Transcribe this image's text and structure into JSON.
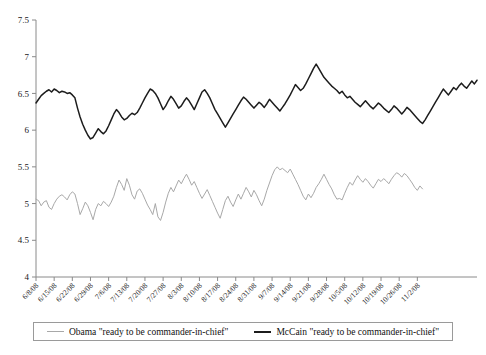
{
  "chart_data": {
    "type": "line",
    "title": "",
    "subtitle": "",
    "xlabel": "",
    "ylabel": "",
    "ylim": [
      4,
      7.5
    ],
    "ytick_step": 0.5,
    "yticks": [
      "7.5",
      "7",
      "6.5",
      "6",
      "5.5",
      "5",
      "4.5",
      "4"
    ],
    "ytick_values": [
      7.5,
      7,
      6.5,
      6,
      5.5,
      5,
      4.5,
      4
    ],
    "grid": false,
    "legend_position": "bottom",
    "x_start": "6/8/08",
    "x_end": "11/2/08",
    "xticks": [
      "6/8/08",
      "6/15/08",
      "6/22/08",
      "6/29/08",
      "7/6/08",
      "7/13/08",
      "7/20/08",
      "7/27/08",
      "8/3/08",
      "8/10/08",
      "8/17/08",
      "8/24/08",
      "8/31/08",
      "9/7/08",
      "9/14/08",
      "9/21/08",
      "9/28/08",
      "10/5/08",
      "10/12/08",
      "10/19/08",
      "10/26/08",
      "11/2/08"
    ],
    "xtick_index": [
      0,
      7,
      14,
      21,
      28,
      35,
      42,
      49,
      56,
      63,
      70,
      77,
      84,
      91,
      98,
      105,
      112,
      119,
      126,
      133,
      140,
      147
    ],
    "n_points": 148,
    "series": [
      {
        "name": "Obama \"ready to be commander-in-chief\"",
        "color": "#a8a8a8",
        "values": [
          5.06,
          5.04,
          4.97,
          5.02,
          5.04,
          4.95,
          4.92,
          5.0,
          5.06,
          5.1,
          5.12,
          5.09,
          5.05,
          5.12,
          5.16,
          5.13,
          5.0,
          4.85,
          4.93,
          5.02,
          4.97,
          4.88,
          4.78,
          4.92,
          5.0,
          4.97,
          5.03,
          5.0,
          4.96,
          5.02,
          5.1,
          5.22,
          5.32,
          5.26,
          5.18,
          5.34,
          5.25,
          5.12,
          5.06,
          5.17,
          5.2,
          5.14,
          5.06,
          4.98,
          4.92,
          4.85,
          5.0,
          4.82,
          4.77,
          4.88,
          5.02,
          5.14,
          5.22,
          5.16,
          5.24,
          5.32,
          5.27,
          5.34,
          5.4,
          5.33,
          5.25,
          5.3,
          5.22,
          5.14,
          5.07,
          5.13,
          5.19,
          5.11,
          5.03,
          4.95,
          4.87,
          4.8,
          4.92,
          5.04,
          5.1,
          5.02,
          4.96,
          5.05,
          5.13,
          5.06,
          5.14,
          5.22,
          5.16,
          5.09,
          5.18,
          5.12,
          5.04,
          4.97,
          5.06,
          5.18,
          5.28,
          5.38,
          5.46,
          5.5,
          5.46,
          5.48,
          5.45,
          5.42,
          5.47,
          5.4,
          5.33,
          5.26,
          5.18,
          5.1,
          5.05,
          5.13,
          5.08,
          5.14,
          5.22,
          5.27,
          5.33,
          5.4,
          5.33,
          5.26,
          5.2,
          5.12,
          5.06,
          5.07,
          5.05,
          5.14,
          5.22,
          5.29,
          5.25,
          5.32,
          5.38,
          5.33,
          5.29,
          5.34,
          5.3,
          5.25,
          5.21,
          5.27,
          5.33,
          5.3,
          5.34,
          5.31,
          5.27,
          5.33,
          5.38,
          5.42,
          5.4,
          5.36,
          5.41,
          5.38,
          5.33,
          5.28,
          5.22,
          5.18,
          5.24,
          5.2
        ]
      },
      {
        "name": "McCain \"ready to be commander-in-chief\"",
        "color": "#1c1c1c",
        "values": [
          6.37,
          6.42,
          6.47,
          6.5,
          6.53,
          6.55,
          6.52,
          6.56,
          6.54,
          6.51,
          6.53,
          6.52,
          6.5,
          6.51,
          6.48,
          6.44,
          6.3,
          6.18,
          6.08,
          6.0,
          5.93,
          5.88,
          5.9,
          5.96,
          6.02,
          5.98,
          5.95,
          5.99,
          6.06,
          6.14,
          6.22,
          6.28,
          6.24,
          6.18,
          6.14,
          6.16,
          6.2,
          6.23,
          6.21,
          6.24,
          6.3,
          6.37,
          6.44,
          6.5,
          6.56,
          6.54,
          6.5,
          6.44,
          6.36,
          6.28,
          6.33,
          6.4,
          6.46,
          6.42,
          6.36,
          6.3,
          6.33,
          6.39,
          6.44,
          6.4,
          6.34,
          6.28,
          6.36,
          6.44,
          6.52,
          6.55,
          6.5,
          6.44,
          6.36,
          6.28,
          6.22,
          6.16,
          6.1,
          6.04,
          6.1,
          6.16,
          6.22,
          6.28,
          6.34,
          6.4,
          6.45,
          6.42,
          6.38,
          6.34,
          6.3,
          6.34,
          6.38,
          6.35,
          6.31,
          6.36,
          6.42,
          6.38,
          6.34,
          6.3,
          6.26,
          6.31,
          6.36,
          6.42,
          6.48,
          6.55,
          6.62,
          6.58,
          6.54,
          6.57,
          6.63,
          6.7,
          6.77,
          6.84,
          6.9,
          6.84,
          6.78,
          6.72,
          6.68,
          6.64,
          6.6,
          6.57,
          6.54,
          6.5,
          6.53,
          6.48,
          6.44,
          6.46,
          6.42,
          6.38,
          6.35,
          6.32,
          6.36,
          6.4,
          6.36,
          6.32,
          6.29,
          6.33,
          6.37,
          6.34,
          6.3,
          6.27,
          6.24,
          6.28,
          6.33,
          6.3,
          6.26,
          6.22,
          6.26,
          6.31,
          6.28,
          6.24,
          6.2,
          6.16,
          6.12,
          6.09,
          6.14,
          6.2,
          6.26,
          6.32,
          6.38,
          6.44,
          6.5,
          6.56,
          6.52,
          6.48,
          6.53,
          6.58,
          6.55,
          6.6,
          6.64,
          6.6,
          6.57,
          6.62,
          6.67,
          6.63,
          6.68
        ]
      }
    ]
  },
  "legend": {
    "items": [
      {
        "label": "Obama \"ready to be commander-in-chief\"",
        "swatch": "obama-line-swatch"
      },
      {
        "label": "McCain \"ready to be commander-in-chief\"",
        "swatch": "mccain-line-swatch"
      }
    ]
  }
}
